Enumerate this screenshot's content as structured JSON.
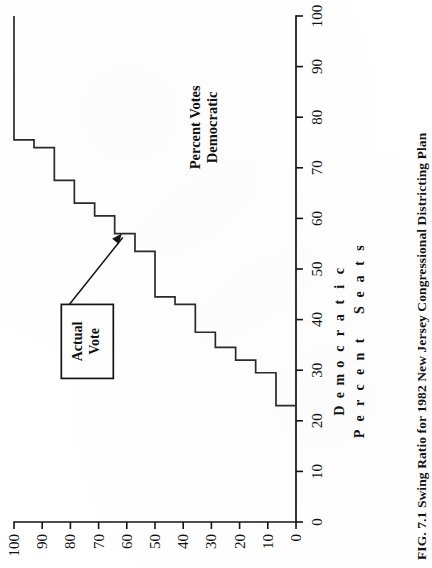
{
  "figure": {
    "caption": "FIG. 7.1   Swing Ratio for 1982 New Jersey Congressional Districting Plan",
    "caption_label": "FIG. 7.1",
    "annotation_label_line1": "Actual",
    "annotation_label_line2": "Vote",
    "x_axis_title_line1": "Percent Votes",
    "x_axis_title_line2": "Democratic",
    "y_axis_title_line1": "Percent Seats",
    "y_axis_title_line2": "Democratic",
    "ink_color": "#141414",
    "paper_color": "#ffffff"
  },
  "chart_data": {
    "type": "line",
    "title": "Swing Ratio for 1982 New Jersey Congressional Districting Plan",
    "xlabel": "Percent Votes Democratic",
    "ylabel": "Percent Seats Democratic",
    "xlim": [
      0,
      100
    ],
    "ylim": [
      0,
      100
    ],
    "xticks": [
      0,
      10,
      20,
      30,
      40,
      50,
      60,
      70,
      80,
      90,
      100
    ],
    "yticks": [
      0,
      10,
      20,
      30,
      40,
      50,
      60,
      70,
      80,
      90,
      100
    ],
    "xtick_labels": [
      "0",
      "10",
      "20",
      "30",
      "40",
      "50",
      "60",
      "70",
      "80",
      "90",
      "100"
    ],
    "ytick_labels": [
      "0",
      "10",
      "20",
      "30",
      "40",
      "50",
      "60",
      "70",
      "80",
      "90",
      "100"
    ],
    "grid": false,
    "legend": null,
    "step_style": "post",
    "series": [
      {
        "name": "Seats won by Democrats",
        "x": [
          23.0,
          23.0,
          29.5,
          29.5,
          32.0,
          32.0,
          34.5,
          34.5,
          37.5,
          37.5,
          43.0,
          43.0,
          44.5,
          44.5,
          53.5,
          53.5,
          57.0,
          57.0,
          60.5,
          60.5,
          63.0,
          63.0,
          67.5,
          67.5,
          74.0,
          74.0,
          75.5,
          75.5,
          100.0
        ],
        "y": [
          0.0,
          7.1,
          7.1,
          14.3,
          14.3,
          21.4,
          21.4,
          28.6,
          28.6,
          35.7,
          35.7,
          42.9,
          42.9,
          50.0,
          50.0,
          57.1,
          57.1,
          64.3,
          64.3,
          71.4,
          71.4,
          78.6,
          78.6,
          85.7,
          85.7,
          92.9,
          92.9,
          100.0,
          100.0
        ]
      }
    ],
    "annotations": [
      {
        "label": "Actual Vote",
        "points_to_x": 57.0,
        "points_to_y": 62.5,
        "box_x": 43.0,
        "box_y": 74.0
      }
    ]
  }
}
